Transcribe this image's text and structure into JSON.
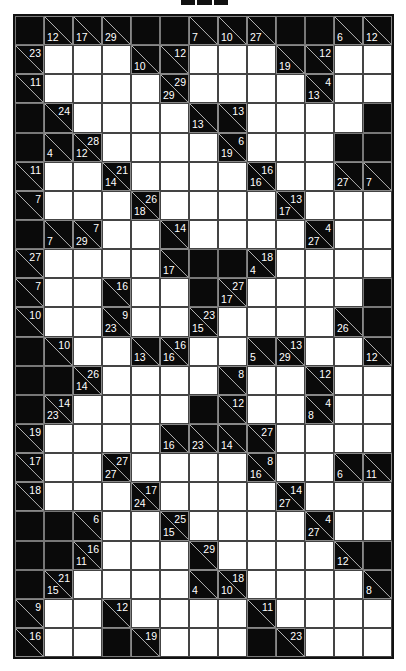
{
  "puzzle": {
    "type": "kakuro",
    "columns": 13,
    "rows_count": 22,
    "legend": {
      "W": "white-entry-cell",
      "B": "black-blocked-cell",
      "clue": "{d: down-sum, r: across-sum}"
    },
    "rows": [
      [
        "B",
        {
          "d": 12
        },
        {
          "d": 17
        },
        {
          "d": 29
        },
        "B",
        "B",
        {
          "d": 7
        },
        {
          "d": 10
        },
        {
          "d": 27
        },
        "B",
        "B",
        {
          "d": 6
        },
        {
          "d": 12
        }
      ],
      [
        {
          "r": 23
        },
        "W",
        "W",
        "W",
        {
          "d": 10
        },
        {
          "r": 12
        },
        "W",
        "W",
        "W",
        {
          "d": 19
        },
        {
          "r": 12
        },
        "W",
        "W"
      ],
      [
        {
          "r": 11
        },
        "W",
        "W",
        "W",
        "W",
        {
          "d": 29,
          "r": 29
        },
        "W",
        "W",
        "W",
        "W",
        {
          "d": 13,
          "r": 4
        },
        "W",
        "W"
      ],
      [
        "B",
        {
          "r": 24
        },
        "W",
        "W",
        "W",
        "W",
        {
          "d": 13
        },
        {
          "r": 13
        },
        "W",
        "W",
        "W",
        "W",
        "B"
      ],
      [
        "B",
        {
          "d": 4
        },
        {
          "d": 12,
          "r": 28
        },
        "W",
        "W",
        "W",
        "W",
        {
          "d": 19,
          "r": 6
        },
        "W",
        "W",
        "W",
        "B",
        "B"
      ],
      [
        {
          "r": 11
        },
        "W",
        "W",
        {
          "d": 14,
          "r": 21
        },
        "W",
        "W",
        "W",
        "W",
        {
          "d": 16,
          "r": 16
        },
        "W",
        "W",
        {
          "d": 27
        },
        {
          "d": 7
        }
      ],
      [
        {
          "r": 7
        },
        "W",
        "W",
        "W",
        {
          "d": 18,
          "r": 26
        },
        "W",
        "W",
        "W",
        "W",
        {
          "d": 17,
          "r": 13
        },
        "W",
        "W",
        "W"
      ],
      [
        "B",
        {
          "d": 7
        },
        {
          "d": 29,
          "r": 7
        },
        "W",
        "W",
        {
          "r": 14
        },
        "W",
        "W",
        "W",
        "W",
        {
          "d": 27,
          "r": 4
        },
        "W",
        "W"
      ],
      [
        {
          "r": 27
        },
        "W",
        "W",
        "W",
        "W",
        {
          "d": 17
        },
        "B",
        "B",
        {
          "d": 4,
          "r": 18
        },
        "W",
        "W",
        "W",
        "W"
      ],
      [
        {
          "r": 7
        },
        "W",
        "W",
        {
          "r": 16
        },
        "W",
        "W",
        "B",
        {
          "d": 17,
          "r": 27
        },
        "W",
        "W",
        "W",
        "W",
        "B"
      ],
      [
        {
          "r": 10
        },
        "W",
        "W",
        {
          "d": 23,
          "r": 9
        },
        "W",
        "W",
        {
          "d": 15,
          "r": 23
        },
        "W",
        "W",
        "W",
        "W",
        {
          "d": 26
        },
        "B"
      ],
      [
        "B",
        {
          "r": 10
        },
        "W",
        "W",
        {
          "d": 13
        },
        {
          "d": 16,
          "r": 16
        },
        "W",
        "W",
        {
          "d": 5
        },
        {
          "d": 29,
          "r": 13
        },
        "W",
        "W",
        {
          "d": 12
        }
      ],
      [
        "B",
        "B",
        {
          "d": 14,
          "r": 26
        },
        "W",
        "W",
        "W",
        "W",
        {
          "r": 8
        },
        "W",
        "W",
        {
          "r": 12
        },
        "W",
        "W"
      ],
      [
        "B",
        {
          "d": 23,
          "r": 14
        },
        "W",
        "W",
        "W",
        "W",
        "B",
        {
          "r": 12
        },
        "W",
        "W",
        {
          "d": 8,
          "r": 4
        },
        "W",
        "W"
      ],
      [
        {
          "r": 19
        },
        "W",
        "W",
        "W",
        "W",
        {
          "d": 16
        },
        {
          "d": 23
        },
        {
          "d": 14
        },
        {
          "r": 27
        },
        "W",
        "W",
        "W",
        "W"
      ],
      [
        {
          "r": 17
        },
        "W",
        "W",
        {
          "d": 27,
          "r": 27
        },
        "W",
        "W",
        "W",
        "W",
        {
          "d": 16,
          "r": 8
        },
        "W",
        "W",
        {
          "d": 6
        },
        {
          "d": 11
        }
      ],
      [
        {
          "r": 18
        },
        "W",
        "W",
        "W",
        {
          "d": 24,
          "r": 17
        },
        "W",
        "W",
        "W",
        "W",
        {
          "d": 27,
          "r": 14
        },
        "W",
        "W",
        "W"
      ],
      [
        "B",
        "B",
        {
          "r": 6
        },
        "W",
        "W",
        {
          "d": 15,
          "r": 25
        },
        "W",
        "W",
        "W",
        "W",
        {
          "d": 27,
          "r": 4
        },
        "W",
        "W"
      ],
      [
        "B",
        "B",
        {
          "d": 11,
          "r": 16
        },
        "W",
        "W",
        "W",
        {
          "r": 29
        },
        "W",
        "W",
        "W",
        "W",
        {
          "d": 12
        },
        "B"
      ],
      [
        "B",
        {
          "d": 15,
          "r": 21
        },
        "W",
        "W",
        "W",
        "W",
        {
          "d": 4
        },
        {
          "d": 10,
          "r": 18
        },
        "W",
        "W",
        "W",
        "W",
        {
          "d": 8
        }
      ],
      [
        {
          "r": 9
        },
        "W",
        "W",
        {
          "r": 12
        },
        "W",
        "W",
        "W",
        "W",
        {
          "r": 11
        },
        "W",
        "W",
        "W",
        "W"
      ],
      [
        {
          "r": 16
        },
        "W",
        "W",
        "B",
        {
          "r": 19
        },
        "W",
        "W",
        "W",
        "B",
        {
          "r": 23
        },
        "W",
        "W",
        "W"
      ]
    ]
  }
}
